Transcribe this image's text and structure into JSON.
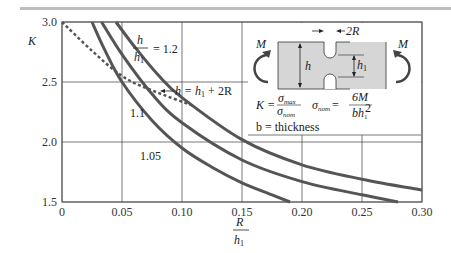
{
  "chart_data": {
    "type": "line",
    "title": "",
    "xlabel": "R / h1",
    "ylabel": "K",
    "xlim": [
      0,
      0.3
    ],
    "ylim": [
      1.5,
      3.0
    ],
    "xticks": [
      "0",
      "0.05",
      "0.10",
      "0.15",
      "0.20",
      "0.25",
      "0.30"
    ],
    "yticks": [
      "1.5",
      "2.0",
      "2.5",
      "3.0"
    ],
    "grid": true,
    "series": [
      {
        "name": "h/h1 = 1.05",
        "label": "1.05",
        "x": [
          0.025,
          0.035,
          0.05,
          0.075,
          0.1,
          0.125,
          0.15,
          0.175,
          0.19
        ],
        "y": [
          3.0,
          2.78,
          2.5,
          2.18,
          1.95,
          1.79,
          1.66,
          1.56,
          1.5
        ]
      },
      {
        "name": "h/h1 = 1.1",
        "label": "1.1",
        "x": [
          0.033,
          0.05,
          0.075,
          0.1,
          0.15,
          0.2,
          0.25,
          0.28
        ],
        "y": [
          3.0,
          2.73,
          2.4,
          2.16,
          1.85,
          1.67,
          1.56,
          1.5
        ]
      },
      {
        "name": "h/h1 = 1.2",
        "label": "h/h1 = 1.2",
        "x": [
          0.045,
          0.06,
          0.08,
          0.1,
          0.15,
          0.2,
          0.25,
          0.3
        ],
        "y": [
          3.0,
          2.8,
          2.56,
          2.37,
          2.02,
          1.81,
          1.69,
          1.6
        ]
      },
      {
        "name": "h = h1 + 2R",
        "style": "dashed",
        "x": [
          0.0,
          0.025,
          0.05,
          0.075,
          0.11
        ],
        "y": [
          3.0,
          2.76,
          2.55,
          2.43,
          2.3
        ]
      }
    ],
    "annotations": [
      "h/h1 = 1.2",
      "1.1",
      "1.05",
      "h = h1 + 2R"
    ]
  },
  "labels": {
    "ratio_num": "h",
    "ratio_den": "h",
    "ratio_den_sub": "1",
    "ratio_val": "= 1.2",
    "c11": "1.1",
    "c105": "1.05",
    "dashed": "h = h",
    "dashed_sub": "1",
    "dashed_rest": " + 2R"
  },
  "inset": {
    "moment": "M",
    "width_label": "2R",
    "h": "h",
    "h1": "h",
    "h1_sub": "1",
    "formula_K": "K =",
    "sigma_max": "σ",
    "max": "max",
    "sigma_nom": "σ",
    "nom": "nom",
    "sigma_nom2": "σ",
    "nom2": "nom",
    "eq": "=",
    "six_m": "6M",
    "bh": "bh",
    "sub1": "1",
    "sup2": "2",
    "thickness": "b = thickness"
  },
  "axes": {
    "y_title": "K",
    "x_title_num": "R",
    "x_title_den": "h",
    "x_title_sub": "1"
  },
  "colors": {
    "curve": "#555555",
    "grid": "#555555",
    "inset_fill": "#d6d6d6"
  }
}
